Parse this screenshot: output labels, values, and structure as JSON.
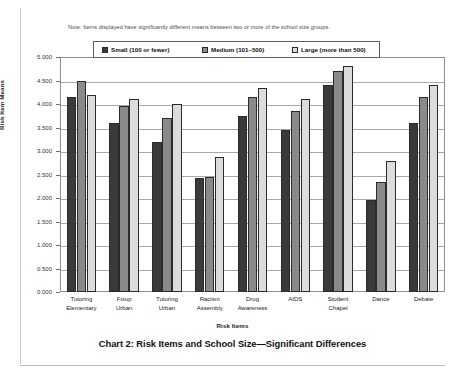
{
  "note": "Note: Items displayed have significantly different means between two or more of the school size groups.",
  "caption": "Chart 2: Risk Items and School Size—Significant Differences",
  "legend": {
    "items": [
      {
        "label": "Small (100 or fewer)",
        "color": "#3a3a3a"
      },
      {
        "label": "Medium (101–500)",
        "color": "#8a8a8a"
      },
      {
        "label": "Large (more than 500)",
        "color": "#dcdcdc"
      }
    ]
  },
  "chart_data": {
    "type": "bar",
    "title": "Chart 2: Risk Items and School Size—Significant Differences",
    "xlabel": "Risk Items",
    "ylabel": "Risk Item Means",
    "ylim": [
      0,
      5
    ],
    "ytick_labels": [
      "5.000",
      "4.500",
      "4.000",
      "3.500",
      "3.000",
      "2.500",
      "2.000",
      "1.500",
      "1.000",
      "0.500",
      "0.000"
    ],
    "ytick_values": [
      5,
      4.5,
      4,
      3.5,
      3,
      2.5,
      2,
      1.5,
      1,
      0.5,
      0
    ],
    "grid": true,
    "legend_position": "top-inside",
    "categories": [
      [
        "Tutoring",
        "Elementary"
      ],
      [
        "Fixup",
        "Urban"
      ],
      [
        "Tutoring",
        "Urban"
      ],
      [
        "Racism",
        "Assembly"
      ],
      [
        "Drug",
        "Awareness"
      ],
      [
        "AIDS",
        ""
      ],
      [
        "Student",
        "Chapel"
      ],
      [
        "Dance",
        ""
      ],
      [
        "Debate",
        ""
      ]
    ],
    "category_labels": [
      "Tutoring Elementary",
      "Fixup Urban",
      "Tutoring Urban",
      "Racism Assembly",
      "Drug Awareness",
      "AIDS",
      "Student Chapel",
      "Dance",
      "Debate"
    ],
    "series": [
      {
        "name": "Small (100 or fewer)",
        "color": "#3a3a3a",
        "values": [
          4.15,
          3.6,
          3.2,
          2.42,
          3.75,
          3.45,
          4.4,
          1.95,
          3.6
        ]
      },
      {
        "name": "Medium (101–500)",
        "color": "#8a8a8a",
        "values": [
          4.5,
          3.95,
          3.7,
          2.44,
          4.15,
          3.85,
          4.7,
          2.35,
          4.15
        ]
      },
      {
        "name": "Large (more than 500)",
        "color": "#dcdcdc",
        "values": [
          4.2,
          4.1,
          4.0,
          2.88,
          4.35,
          4.1,
          4.8,
          2.78,
          4.4
        ]
      }
    ]
  }
}
